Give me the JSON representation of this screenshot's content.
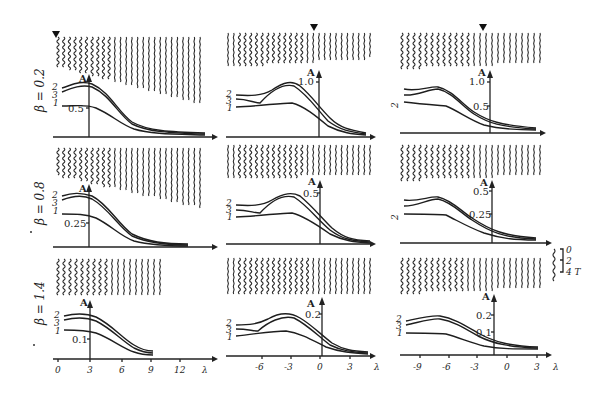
{
  "figure": {
    "row_labels": [
      "β = 0.2",
      "β = 0.8",
      "β = 1.4"
    ],
    "x_axis_label": "λ",
    "y_axis_label": "A",
    "curve_labels": [
      "2",
      "3",
      "1"
    ],
    "scale_bar": {
      "labels": [
        "0",
        "2",
        "4 T"
      ]
    }
  },
  "chart_data": [
    {
      "type": "line",
      "row": 1,
      "col": 1,
      "beta": 0.2,
      "xlabel": "λ",
      "ylabel": "A",
      "y_axis_at_x": 3,
      "y_ticks": [
        0.5
      ],
      "x_ticks": [
        0,
        3,
        6,
        9,
        12
      ],
      "series": [
        {
          "name": "2",
          "x": [
            0,
            2,
            3,
            5,
            7,
            9,
            12,
            15
          ],
          "values": [
            0.85,
            0.9,
            0.88,
            0.6,
            0.3,
            0.12,
            0.05,
            0.03
          ]
        },
        {
          "name": "3",
          "x": [
            0,
            2,
            3,
            5,
            7,
            9,
            12,
            15
          ],
          "values": [
            0.75,
            0.85,
            0.84,
            0.55,
            0.27,
            0.11,
            0.04,
            0.03
          ]
        },
        {
          "name": "1",
          "x": [
            0,
            2,
            3,
            5,
            7,
            9,
            12,
            15
          ],
          "values": [
            0.55,
            0.55,
            0.53,
            0.38,
            0.2,
            0.08,
            0.03,
            0.02
          ]
        }
      ]
    },
    {
      "type": "line",
      "row": 1,
      "col": 2,
      "beta": 0.2,
      "xlabel": "λ",
      "ylabel": "A",
      "y_axis_at_x": 0,
      "y_ticks": [
        1.0
      ],
      "x_ticks": [
        -6,
        -3,
        0,
        3
      ],
      "series": [
        {
          "name": "2",
          "x": [
            -9,
            -6,
            -4,
            -3,
            -1,
            0,
            2,
            4
          ],
          "values": [
            0.8,
            0.8,
            0.95,
            0.95,
            0.7,
            0.5,
            0.2,
            0.1
          ]
        },
        {
          "name": "3",
          "x": [
            -9,
            -6,
            -4,
            -3,
            -1,
            0,
            2,
            4
          ],
          "values": [
            0.72,
            0.65,
            0.88,
            0.9,
            0.65,
            0.45,
            0.17,
            0.09
          ]
        },
        {
          "name": "1",
          "x": [
            -9,
            -6,
            -4,
            -3,
            -1,
            0,
            2,
            4
          ],
          "values": [
            0.5,
            0.55,
            0.6,
            0.6,
            0.45,
            0.32,
            0.14,
            0.08
          ]
        }
      ]
    },
    {
      "type": "line",
      "row": 1,
      "col": 3,
      "beta": 0.2,
      "xlabel": "λ",
      "ylabel": "A",
      "y_axis_at_x": -1.5,
      "y_ticks": [
        0.5,
        1.0
      ],
      "x_ticks": [
        -9,
        -6,
        -3,
        0,
        3
      ],
      "series": [
        {
          "name": "2",
          "x": [
            -10,
            -7,
            -6,
            -3,
            -1.5,
            0,
            3
          ],
          "values": [
            0.85,
            0.9,
            0.88,
            0.5,
            0.3,
            0.15,
            0.08
          ]
        },
        {
          "name": "3",
          "x": [
            -10,
            -7,
            -6,
            -3,
            -1.5,
            0,
            3
          ],
          "values": [
            0.75,
            0.85,
            0.84,
            0.45,
            0.27,
            0.13,
            0.07
          ]
        },
        {
          "name": "1",
          "x": [
            -10,
            -7,
            -6,
            -3,
            -1.5,
            0,
            3
          ],
          "values": [
            0.6,
            0.58,
            0.55,
            0.35,
            0.2,
            0.1,
            0.06
          ]
        }
      ]
    },
    {
      "type": "line",
      "row": 2,
      "col": 1,
      "beta": 0.8,
      "xlabel": "λ",
      "ylabel": "A",
      "y_axis_at_x": 3,
      "y_ticks": [
        0.25
      ],
      "x_ticks": [
        0,
        3,
        6,
        9,
        12
      ],
      "series": [
        {
          "name": "2",
          "x": [
            0,
            2,
            3,
            5,
            7,
            9,
            12,
            15
          ],
          "values": [
            0.5,
            0.53,
            0.5,
            0.35,
            0.18,
            0.08,
            0.03,
            0.02
          ]
        },
        {
          "name": "3",
          "x": [
            0,
            2,
            3,
            5,
            7,
            9,
            12,
            15
          ],
          "values": [
            0.45,
            0.5,
            0.47,
            0.32,
            0.16,
            0.07,
            0.03,
            0.02
          ]
        },
        {
          "name": "1",
          "x": [
            0,
            2,
            3,
            5,
            7,
            9,
            12,
            15
          ],
          "values": [
            0.32,
            0.32,
            0.3,
            0.22,
            0.11,
            0.05,
            0.02,
            0.01
          ]
        }
      ]
    },
    {
      "type": "line",
      "row": 2,
      "col": 2,
      "beta": 0.8,
      "xlabel": "λ",
      "ylabel": "A",
      "y_axis_at_x": 0,
      "y_ticks": [
        0.5
      ],
      "x_ticks": [
        -6,
        -3,
        0,
        3
      ],
      "series": [
        {
          "name": "2",
          "x": [
            -9,
            -6,
            -4,
            -3,
            -1,
            0,
            2,
            4
          ],
          "values": [
            0.35,
            0.35,
            0.45,
            0.47,
            0.35,
            0.25,
            0.1,
            0.05
          ]
        },
        {
          "name": "3",
          "x": [
            -9,
            -6,
            -4,
            -3,
            -1,
            0,
            2,
            4
          ],
          "values": [
            0.3,
            0.27,
            0.42,
            0.44,
            0.32,
            0.22,
            0.09,
            0.04
          ]
        },
        {
          "name": "1",
          "x": [
            -9,
            -6,
            -4,
            -3,
            -1,
            0,
            2,
            4
          ],
          "values": [
            0.2,
            0.22,
            0.25,
            0.25,
            0.2,
            0.15,
            0.07,
            0.03
          ]
        }
      ]
    },
    {
      "type": "line",
      "row": 2,
      "col": 3,
      "beta": 0.8,
      "xlabel": "λ",
      "ylabel": "A",
      "y_axis_at_x": -1.5,
      "y_ticks": [
        0.25,
        0.5
      ],
      "x_ticks": [
        -9,
        -6,
        -3,
        0,
        3
      ],
      "series": [
        {
          "name": "2",
          "x": [
            -10,
            -7,
            -6,
            -3,
            -1.5,
            0,
            3
          ],
          "values": [
            0.38,
            0.42,
            0.4,
            0.22,
            0.13,
            0.07,
            0.04
          ]
        },
        {
          "name": "3",
          "x": [
            -10,
            -7,
            -6,
            -3,
            -1.5,
            0,
            3
          ],
          "values": [
            0.33,
            0.38,
            0.37,
            0.2,
            0.12,
            0.06,
            0.04
          ]
        },
        {
          "name": "1",
          "x": [
            -10,
            -7,
            -6,
            -3,
            -1.5,
            0,
            3
          ],
          "values": [
            0.25,
            0.25,
            0.24,
            0.15,
            0.09,
            0.05,
            0.03
          ]
        }
      ]
    },
    {
      "type": "line",
      "row": 3,
      "col": 1,
      "beta": 1.4,
      "xlabel": "λ",
      "ylabel": "A",
      "y_axis_at_x": 3,
      "y_ticks": [
        0.1
      ],
      "x_ticks": [
        0,
        3,
        6,
        9,
        12
      ],
      "series": [
        {
          "name": "2",
          "x": [
            0,
            2,
            3,
            5,
            7,
            9
          ],
          "values": [
            0.2,
            0.21,
            0.2,
            0.14,
            0.08,
            0.05
          ]
        },
        {
          "name": "3",
          "x": [
            0,
            2,
            3,
            5,
            7,
            9
          ],
          "values": [
            0.18,
            0.19,
            0.18,
            0.12,
            0.07,
            0.04
          ]
        },
        {
          "name": "1",
          "x": [
            0,
            2,
            3,
            5,
            7,
            9
          ],
          "values": [
            0.13,
            0.13,
            0.12,
            0.09,
            0.05,
            0.03
          ]
        }
      ]
    },
    {
      "type": "line",
      "row": 3,
      "col": 2,
      "beta": 1.4,
      "xlabel": "λ",
      "ylabel": "A",
      "y_axis_at_x": 0,
      "y_ticks": [
        0.2
      ],
      "x_ticks": [
        -6,
        -3,
        0,
        3
      ],
      "series": [
        {
          "name": "2",
          "x": [
            -9,
            -6,
            -4,
            -3,
            -1,
            0,
            2,
            4
          ],
          "values": [
            0.12,
            0.13,
            0.17,
            0.18,
            0.14,
            0.1,
            0.05,
            0.02
          ]
        },
        {
          "name": "3",
          "x": [
            -9,
            -6,
            -4,
            -3,
            -1,
            0,
            2,
            4
          ],
          "values": [
            0.1,
            0.09,
            0.15,
            0.16,
            0.13,
            0.09,
            0.04,
            0.02
          ]
        },
        {
          "name": "1",
          "x": [
            -9,
            -6,
            -4,
            -3,
            -1,
            0,
            2,
            4
          ],
          "values": [
            0.07,
            0.08,
            0.09,
            0.1,
            0.08,
            0.06,
            0.03,
            0.02
          ]
        }
      ]
    },
    {
      "type": "line",
      "row": 3,
      "col": 3,
      "beta": 1.4,
      "xlabel": "λ",
      "ylabel": "A",
      "y_axis_at_x": -1.5,
      "y_ticks": [
        0.1,
        0.2
      ],
      "x_ticks": [
        -9,
        -6,
        -3,
        0,
        3
      ],
      "series": [
        {
          "name": "2",
          "x": [
            -10,
            -7,
            -6,
            -3,
            -1.5,
            0,
            3
          ],
          "values": [
            0.15,
            0.17,
            0.16,
            0.1,
            0.06,
            0.03,
            0.02
          ]
        },
        {
          "name": "3",
          "x": [
            -10,
            -7,
            -6,
            -3,
            -1.5,
            0,
            3
          ],
          "values": [
            0.14,
            0.16,
            0.15,
            0.09,
            0.055,
            0.03,
            0.02
          ]
        },
        {
          "name": "1",
          "x": [
            -10,
            -7,
            -6,
            -3,
            -1.5,
            0,
            3
          ],
          "values": [
            0.1,
            0.1,
            0.1,
            0.07,
            0.045,
            0.025,
            0.02
          ]
        }
      ]
    }
  ],
  "labels": {
    "r1": {
      "c1_tick": "0.5",
      "c2_tick": "1.0",
      "c3_tick_hi": "1.0",
      "c3_tick_lo": "0.5"
    },
    "r2": {
      "c1_tick": "0.25",
      "c2_tick": "0.5",
      "c3_tick_hi": "0.5",
      "c3_tick_lo": "0.25"
    },
    "r3": {
      "c1_tick": "0.1",
      "c2_tick": "0.2",
      "c3_tick_hi": "0.2",
      "c3_tick_lo": "0.1"
    },
    "x_ticks_c1": [
      "0",
      "3",
      "6",
      "9",
      "12"
    ],
    "x_ticks_c2": [
      "-6",
      "-3",
      "0",
      "3"
    ],
    "x_ticks_c3": [
      "-9",
      "-6",
      "-3",
      "0",
      "3"
    ]
  }
}
